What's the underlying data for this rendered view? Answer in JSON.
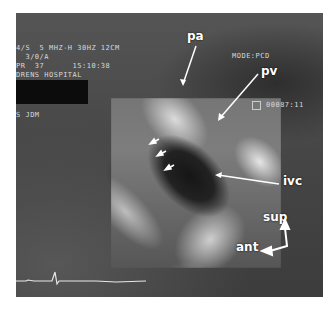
{
  "ultrasound": {
    "header_lines": [
      "4/S  5 MHZ-H 30HZ 12CM",
      "  3/0/A",
      "PR  37      15:10:38",
      "DRENS HOSPITAL"
    ],
    "operator": "S JDM",
    "mode": "MODE:PCD",
    "frame_counter": "00087:11",
    "frame_icon": "calendar-icon"
  },
  "annotations": {
    "pa": "pa",
    "pv": "pv",
    "ivc": "ivc",
    "sup": "sup",
    "ant": "ant"
  },
  "colors": {
    "background": "#ffffff",
    "image_gray": "#4a4a4a",
    "label": "#ffffff"
  }
}
